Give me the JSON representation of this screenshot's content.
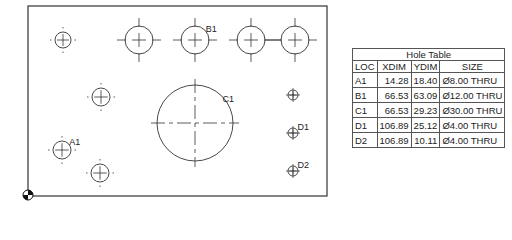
{
  "drawing": {
    "plate": {
      "x": 28,
      "y": 6,
      "width": 299,
      "height": 190
    },
    "stroke_color": "#333333",
    "holes": [
      {
        "id": "top-left",
        "cx": 63,
        "cy": 40,
        "r": 8,
        "label": ""
      },
      {
        "id": "top-1",
        "cx": 139,
        "cy": 40,
        "r": 14,
        "label": ""
      },
      {
        "id": "B1",
        "cx": 195,
        "cy": 40,
        "r": 14,
        "label": "B1"
      },
      {
        "id": "top-3",
        "cx": 251,
        "cy": 40,
        "r": 14,
        "label": ""
      },
      {
        "id": "top-4",
        "cx": 295,
        "cy": 40,
        "r": 14,
        "label": ""
      },
      {
        "id": "mid-left",
        "cx": 101,
        "cy": 97,
        "r": 9,
        "label": ""
      },
      {
        "id": "C1",
        "cx": 195,
        "cy": 123,
        "r": 38,
        "label": "C1"
      },
      {
        "id": "A1",
        "cx": 62,
        "cy": 150,
        "r": 9,
        "label": "A1"
      },
      {
        "id": "bottom-left",
        "cx": 100,
        "cy": 173,
        "r": 9,
        "label": ""
      },
      {
        "id": "small-top",
        "cx": 293,
        "cy": 95,
        "r": 5,
        "label": ""
      },
      {
        "id": "D1",
        "cx": 293,
        "cy": 133,
        "r": 5,
        "label": "D1"
      },
      {
        "id": "D2",
        "cx": 293,
        "cy": 171,
        "r": 5,
        "label": "D2"
      }
    ],
    "origin": {
      "x": 28,
      "y": 195
    }
  },
  "hole_table": {
    "title": "Hole Table",
    "headers": [
      "LOC",
      "XDIM",
      "YDIM",
      "SIZE"
    ],
    "rows": [
      {
        "loc": "A1",
        "xdim": "14.28",
        "ydim": "18.40",
        "size": "Ø8.00 THRU"
      },
      {
        "loc": "B1",
        "xdim": "66.53",
        "ydim": "63.09",
        "size": "Ø12.00 THRU"
      },
      {
        "loc": "C1",
        "xdim": "66.53",
        "ydim": "29.23",
        "size": "Ø30.00 THRU"
      },
      {
        "loc": "D1",
        "xdim": "106.89",
        "ydim": "25.12",
        "size": "Ø4.00 THRU"
      },
      {
        "loc": "D2",
        "xdim": "106.89",
        "ydim": "10.11",
        "size": "Ø4.00 THRU"
      }
    ]
  }
}
